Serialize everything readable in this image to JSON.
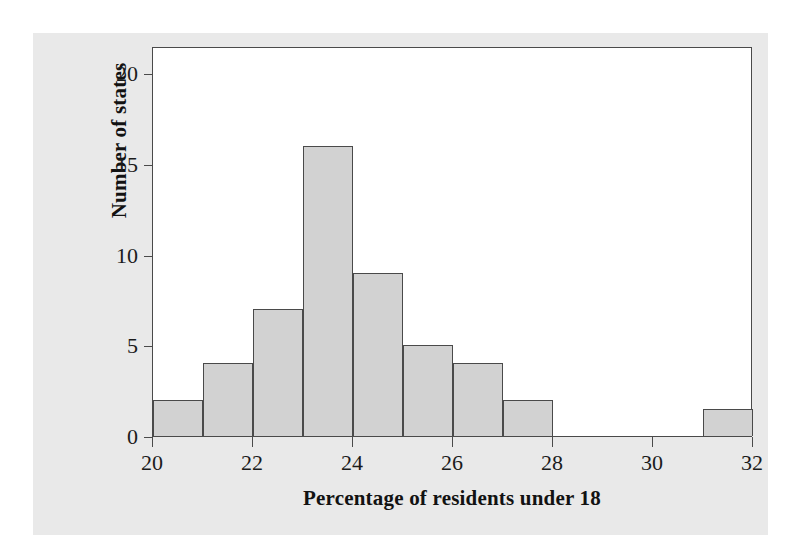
{
  "chart_data": {
    "type": "bar",
    "title": "",
    "subtitle": "",
    "xlabel": "Percentage of residents under 18",
    "ylabel": "Number of states",
    "xlim": [
      20,
      32
    ],
    "ylim": [
      0,
      21.5
    ],
    "bin_width": 1,
    "grid": false,
    "legend": null,
    "xticks": [
      "20",
      "22",
      "24",
      "26",
      "28",
      "30",
      "32"
    ],
    "xtick_values": [
      20,
      22,
      24,
      26,
      28,
      30,
      32
    ],
    "yticks": [
      "0",
      "5",
      "10",
      "15",
      "20"
    ],
    "ytick_values": [
      0,
      5,
      10,
      15,
      20
    ],
    "bins": [
      {
        "label": "20-21",
        "start": 20,
        "end": 21,
        "value": 2
      },
      {
        "label": "21-22",
        "start": 21,
        "end": 22,
        "value": 4
      },
      {
        "label": "22-23",
        "start": 22,
        "end": 23,
        "value": 7
      },
      {
        "label": "23-24",
        "start": 23,
        "end": 24,
        "value": 16
      },
      {
        "label": "24-25",
        "start": 24,
        "end": 25,
        "value": 9
      },
      {
        "label": "25-26",
        "start": 25,
        "end": 26,
        "value": 5
      },
      {
        "label": "26-27",
        "start": 26,
        "end": 27,
        "value": 4
      },
      {
        "label": "27-28",
        "start": 27,
        "end": 28,
        "value": 2
      },
      {
        "label": "28-29",
        "start": 28,
        "end": 29,
        "value": 0
      },
      {
        "label": "29-30",
        "start": 29,
        "end": 30,
        "value": 0
      },
      {
        "label": "30-31",
        "start": 30,
        "end": 31,
        "value": 0
      },
      {
        "label": "31-32",
        "start": 31,
        "end": 32,
        "value": 1.5
      }
    ],
    "categories": [
      "20-21",
      "21-22",
      "22-23",
      "23-24",
      "24-25",
      "25-26",
      "26-27",
      "27-28",
      "28-29",
      "29-30",
      "30-31",
      "31-32"
    ],
    "values": [
      2,
      4,
      7,
      16,
      9,
      5,
      4,
      2,
      0,
      0,
      0,
      1.5
    ],
    "colors": {
      "bar_fill": "#d2d2d2",
      "bar_edge": "#4a4a4a",
      "axis": "#4a4a4a",
      "plot_background": "#ffffff",
      "figure_background": "#e9e9e9",
      "page_background": "#ffffff",
      "text": "#1b1b1b"
    }
  }
}
